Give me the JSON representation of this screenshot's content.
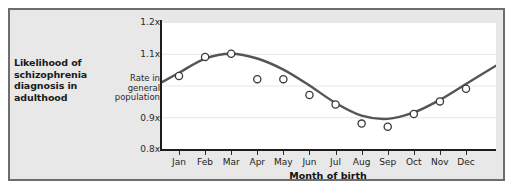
{
  "caption": {
    "text": "Likelihood of schizophrenia diagnosis in adulthood"
  },
  "chart_data": {
    "type": "scatter",
    "title": "",
    "subtitle": "",
    "xlabel": "Month of birth",
    "ylabel": "",
    "categories": [
      "Jan",
      "Feb",
      "Mar",
      "Apr",
      "May",
      "Jun",
      "Jul",
      "Aug",
      "Sep",
      "Oct",
      "Nov",
      "Dec"
    ],
    "series": [
      {
        "name": "Observed rate",
        "type": "scatter",
        "values": [
          1.03,
          1.09,
          1.1,
          1.02,
          1.02,
          0.97,
          0.94,
          0.88,
          0.87,
          0.91,
          0.95,
          0.99
        ]
      },
      {
        "name": "Fitted trend",
        "type": "line",
        "values": [
          1.04,
          1.085,
          1.1,
          1.085,
          1.05,
          1.0,
          0.945,
          0.905,
          0.895,
          0.915,
          0.955,
          1.005
        ]
      }
    ],
    "ylim": [
      0.8,
      1.2
    ],
    "yticks": [
      "0.8x",
      "0.9x",
      "1.1x",
      "1.2x"
    ],
    "ytick_values": [
      0.8,
      0.9,
      1.1,
      1.2
    ],
    "baseline_label": "Rate in general population",
    "baseline_value": 1.0,
    "grid": true,
    "legend": "none",
    "marker_style": "open-circle",
    "line_color": "#555555",
    "marker_edge_color": "#3a3a3a",
    "marker_face_color": "#ffffff",
    "grid_color": "#e6e6e6",
    "plot_background": "#ffffff",
    "panel_background": "#e8e8e8"
  }
}
